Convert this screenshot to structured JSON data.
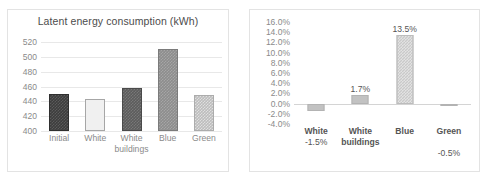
{
  "chart_data": [
    {
      "type": "bar",
      "id": "latent-energy",
      "title": "Latent energy consumption (kWh)",
      "xlabel": "",
      "ylabel": "",
      "categories": [
        "Initial",
        "White",
        "White\nbuildings",
        "Blue",
        "Green"
      ],
      "values": [
        450,
        443,
        458,
        511,
        448
      ],
      "ylim": [
        400,
        520
      ],
      "ytick_step": 20,
      "yticks": [
        "400",
        "420",
        "440",
        "460",
        "480",
        "500",
        "520"
      ],
      "grid": true,
      "legend": "none",
      "bar_styles": [
        "dark-textured",
        "white-outlined",
        "mid-dark-textured",
        "grey-solid",
        "light-textured"
      ]
    },
    {
      "type": "bar",
      "id": "relative-change",
      "title": "",
      "xlabel": "",
      "ylabel": "",
      "categories": [
        "White",
        "White\nbuildings",
        "Blue",
        "Green"
      ],
      "values": [
        -1.5,
        1.7,
        13.5,
        -0.5
      ],
      "data_labels": [
        "-1.5%",
        "1.7%",
        "13.5%",
        "-0.5%"
      ],
      "ylim": [
        -4.0,
        16.0
      ],
      "ytick_step": 2.0,
      "yticks": [
        "16.0%",
        "14.0%",
        "12.0%",
        "10.0%",
        "8.0%",
        "6.0%",
        "4.0%",
        "2.0%",
        "0.0%",
        "-2.0%",
        "-4.0%"
      ],
      "grid": false,
      "zero_line": true,
      "legend": "none",
      "bar_styles": [
        "grey-plain",
        "grey-plain",
        "grey-hatch",
        "grey-plain"
      ]
    }
  ],
  "colors": {
    "panel_border": "#e3e3e3",
    "gridline": "#e8e8e8",
    "zero_line": "#d4d4d4",
    "tick_text": "#8a8a8a",
    "label_text": "#555555",
    "title_text": "#4c4c4c",
    "bar_dark": "#3d3d3d",
    "bar_white": "#f0f0f0",
    "bar_mid": "#5c5c5c",
    "bar_grey": "#8d8d8d",
    "bar_light": "#bdbdbd"
  }
}
